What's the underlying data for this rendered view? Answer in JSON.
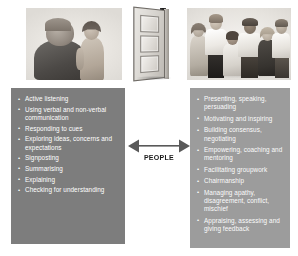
{
  "diagram": {
    "center_connector": {
      "label": "PEOPLE",
      "arrow_type": "double-headed-horizontal",
      "arrow_color": "#595959"
    },
    "illustrations": [
      {
        "name": "one-to-one-conversation",
        "description": "Older adult talking with a young person",
        "style": "grayscale sketch"
      },
      {
        "name": "open-door",
        "description": "Panelled door standing open",
        "style": "grayscale sketch"
      },
      {
        "name": "group-of-people",
        "description": "Group of six people standing together",
        "style": "grayscale sketch"
      }
    ],
    "left_panel": {
      "background_color": "#7d7d7d",
      "text_color": "#ffffff",
      "items": [
        "Active listening",
        "Using verbal and non-verbal communication",
        "Responding to cues",
        "Exploring ideas, concerns and expectations",
        "Signposting",
        "Summarising",
        "Explaining",
        "Checking for understanding"
      ]
    },
    "right_panel": {
      "background_color": "#9c9c9c",
      "text_color": "#fbfbfb",
      "items": [
        "Presenting, speaking, persuading",
        "Motivating and inspiring",
        "Building consensus, negotiating",
        "Empowering, coaching and mentoring",
        "Facilitating groupwork",
        "Chairmanship",
        "Managing apathy, disagreement, conflict, mischief",
        "Appraising, assessing and giving feedback"
      ]
    }
  }
}
